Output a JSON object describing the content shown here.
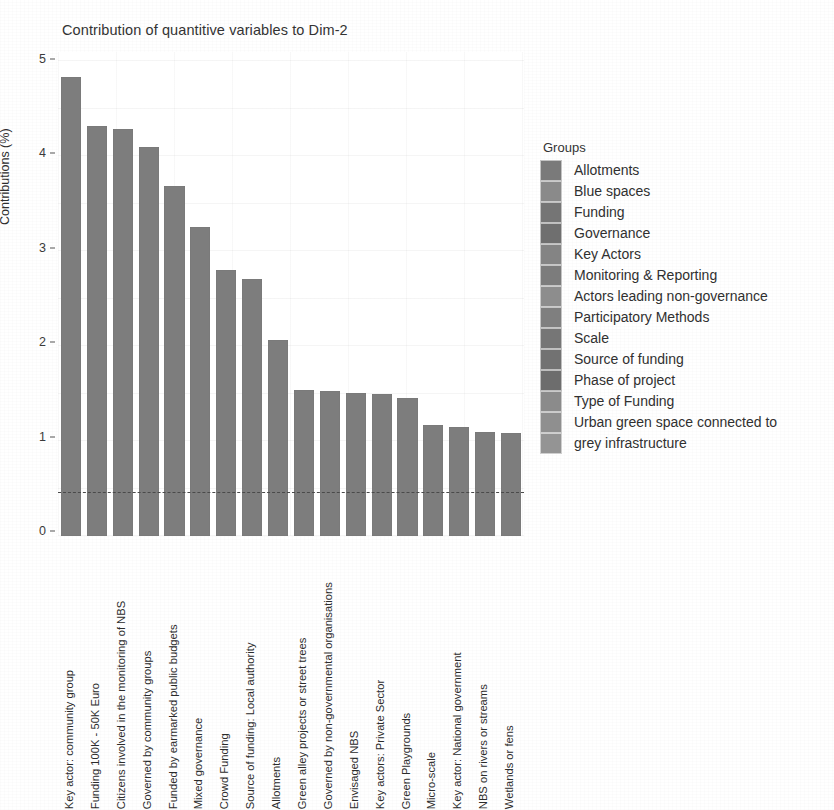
{
  "chart_data": {
    "type": "bar",
    "title": "Contribution of quantitive variables to Dim-2",
    "xlabel": "",
    "ylabel": "Contributions (%)",
    "ylim": [
      0,
      5
    ],
    "y_ticks": [
      0,
      1,
      2,
      3,
      4,
      5
    ],
    "grid": true,
    "legend_position": "right",
    "reference_line": {
      "value": 0.46,
      "style": "dashed",
      "color": "#4a4a4a"
    },
    "bar_color": "#7d7d7d",
    "categories": [
      "Key actor: community group",
      "Funding 100K - 50K Euro",
      "Citizens involved in the monitoring of NBS",
      "Governed by community groups",
      "Funded by earmarked public budgets",
      "Mixed governance",
      "Crowd Funding",
      "Source of funding: Local authority",
      "Allotments",
      "Green alley projects or street trees",
      "Governed by non-governmental organisations",
      "Envisaged NBS",
      "Key actors: Private Sector",
      "Green Playgrounds",
      "Micro-scale",
      "Key actor: National government",
      "NBS on rivers or streams",
      "Wetlands or fens"
    ],
    "values": [
      4.86,
      4.34,
      4.31,
      4.12,
      3.71,
      3.27,
      2.82,
      2.72,
      2.08,
      1.55,
      1.54,
      1.52,
      1.5,
      1.46,
      1.18,
      1.15,
      1.1,
      1.09
    ]
  },
  "legend": {
    "title": "Groups",
    "entries": [
      {
        "label": "Allotments",
        "color": "#7a7a7a"
      },
      {
        "label": "Blue spaces",
        "color": "#8a8a8a"
      },
      {
        "label": "Funding",
        "color": "#757575"
      },
      {
        "label": "Governance",
        "color": "#6f6f6f"
      },
      {
        "label": "Key Actors",
        "color": "#848484"
      },
      {
        "label": "Monitoring & Reporting",
        "color": "#7c7c7c"
      },
      {
        "label": "Actors leading non-governance",
        "color": "#8d8d8d"
      },
      {
        "label": "Participatory Methods",
        "color": "#7f7f7f"
      },
      {
        "label": "Scale",
        "color": "#767676"
      },
      {
        "label": "Source of funding",
        "color": "#727272"
      },
      {
        "label": "Phase of project",
        "color": "#6d6d6d"
      },
      {
        "label": "Type of Funding",
        "color": "#8b8b8b"
      },
      {
        "label": "Urban green space connected to",
        "color": "#8f8f8f"
      },
      {
        "label": "grey infrastructure",
        "color": "#949494"
      }
    ]
  }
}
